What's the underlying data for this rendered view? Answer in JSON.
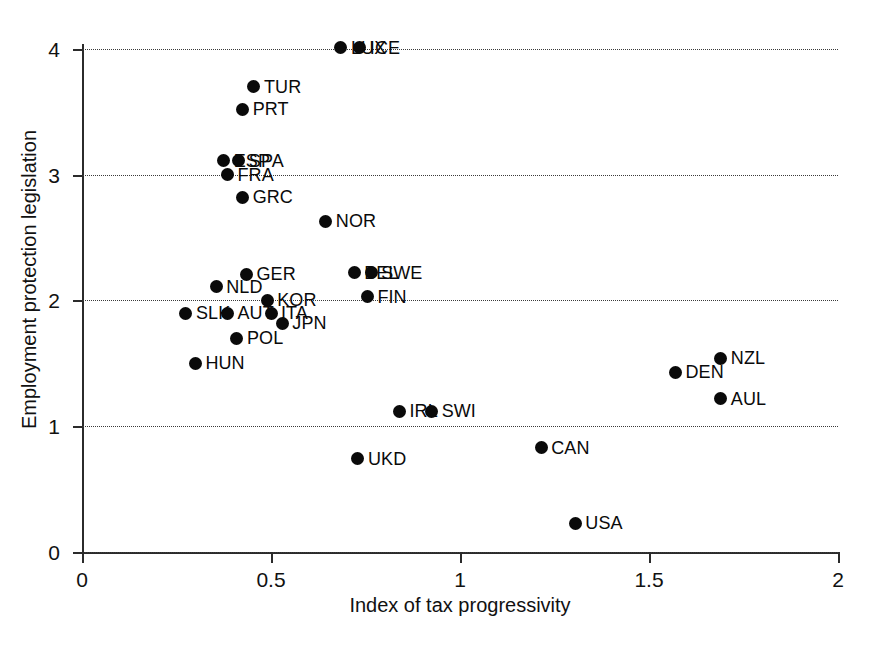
{
  "chart_data": {
    "type": "scatter",
    "title": "",
    "xlabel": "Index of tax progressivity",
    "ylabel": "Employment protection legislation",
    "xlim": [
      0,
      2
    ],
    "ylim": [
      0,
      4.15
    ],
    "xticks": [
      "0",
      "0.5",
      "1",
      "1.5",
      "2"
    ],
    "xtick_values": [
      0,
      0.5,
      1,
      1.5,
      2
    ],
    "yticks": [
      "0",
      "1",
      "2",
      "3",
      "4"
    ],
    "ytick_values": [
      0,
      1,
      2,
      3,
      4
    ],
    "grid": "horizontal-dotted",
    "legend": "none",
    "marker": "filled-circle",
    "marker_color": "#0a0a0a",
    "points": [
      {
        "label": "LUX",
        "x": 0.685,
        "y": 4.01,
        "label_side": "right",
        "label_dx": 10
      },
      {
        "label": "ICE",
        "x": 0.735,
        "y": 4.01,
        "label_side": "right",
        "label_dx": 10
      },
      {
        "label": "TUR",
        "x": 0.455,
        "y": 3.7,
        "label_side": "right",
        "label_dx": 10
      },
      {
        "label": "PRT",
        "x": 0.425,
        "y": 3.52,
        "label_side": "right",
        "label_dx": 10
      },
      {
        "label": "ESP",
        "x": 0.375,
        "y": 3.11,
        "label_side": "right",
        "label_dx": 10
      },
      {
        "label": "SPA",
        "x": 0.415,
        "y": 3.11,
        "label_side": "right",
        "label_dx": 10
      },
      {
        "label": "FRA",
        "x": 0.385,
        "y": 3.0,
        "label_side": "right",
        "label_dx": 10
      },
      {
        "label": "GRC",
        "x": 0.425,
        "y": 2.82,
        "label_side": "right",
        "label_dx": 10
      },
      {
        "label": "NOR",
        "x": 0.645,
        "y": 2.63,
        "label_side": "right",
        "label_dx": 10
      },
      {
        "label": "GER",
        "x": 0.435,
        "y": 2.21,
        "label_side": "right",
        "label_dx": 10
      },
      {
        "label": "BEL",
        "x": 0.72,
        "y": 2.22,
        "label_side": "right",
        "label_dx": 10
      },
      {
        "label": "SWE",
        "x": 0.765,
        "y": 2.22,
        "label_side": "right",
        "label_dx": 10
      },
      {
        "label": "NLD",
        "x": 0.355,
        "y": 2.11,
        "label_side": "right",
        "label_dx": 10
      },
      {
        "label": "KOR",
        "x": 0.49,
        "y": 2.0,
        "label_side": "right",
        "label_dx": 10
      },
      {
        "label": "FIN",
        "x": 0.755,
        "y": 2.03,
        "label_side": "right",
        "label_dx": 10
      },
      {
        "label": "SLK",
        "x": 0.275,
        "y": 1.9,
        "label_side": "right",
        "label_dx": 10
      },
      {
        "label": "AUT",
        "x": 0.385,
        "y": 1.9,
        "label_side": "right",
        "label_dx": 10
      },
      {
        "label": "ITA",
        "x": 0.5,
        "y": 1.9,
        "label_side": "right",
        "label_dx": 10
      },
      {
        "label": "JPN",
        "x": 0.53,
        "y": 1.82,
        "label_side": "right",
        "label_dx": 10
      },
      {
        "label": "POL",
        "x": 0.41,
        "y": 1.7,
        "label_side": "right",
        "label_dx": 10
      },
      {
        "label": "NZL",
        "x": 1.69,
        "y": 1.54,
        "label_side": "right",
        "label_dx": 10
      },
      {
        "label": "HUN",
        "x": 0.3,
        "y": 1.5,
        "label_side": "right",
        "label_dx": 10
      },
      {
        "label": "DEN",
        "x": 1.57,
        "y": 1.43,
        "label_side": "right",
        "label_dx": 10
      },
      {
        "label": "AUL",
        "x": 1.69,
        "y": 1.22,
        "label_side": "right",
        "label_dx": 10
      },
      {
        "label": "IRL",
        "x": 0.84,
        "y": 1.12,
        "label_side": "right",
        "label_dx": 10
      },
      {
        "label": "SWI",
        "x": 0.925,
        "y": 1.12,
        "label_side": "right",
        "label_dx": 10
      },
      {
        "label": "CAN",
        "x": 1.215,
        "y": 0.83,
        "label_side": "right",
        "label_dx": 10
      },
      {
        "label": "UKD",
        "x": 0.73,
        "y": 0.74,
        "label_side": "right",
        "label_dx": 10
      },
      {
        "label": "USA",
        "x": 1.305,
        "y": 0.23,
        "label_side": "right",
        "label_dx": 10
      }
    ]
  }
}
